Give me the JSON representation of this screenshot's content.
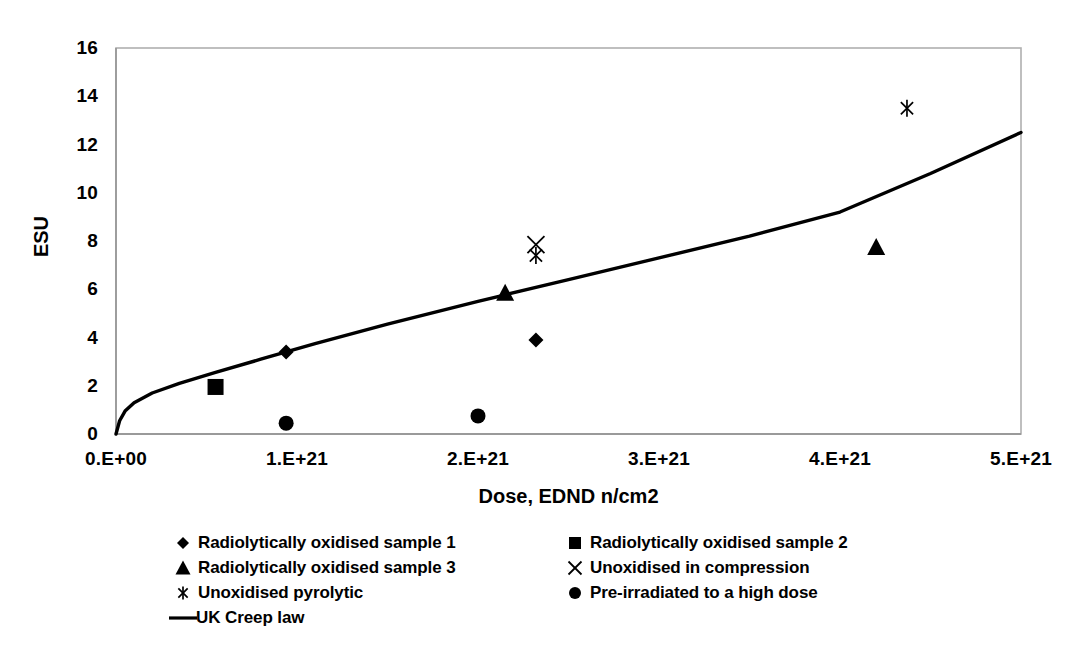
{
  "chart_data": {
    "type": "scatter",
    "title": "",
    "xlabel": "Dose, EDND n/cm2",
    "ylabel": "ESU",
    "xlim": [
      0,
      5e+21
    ],
    "ylim": [
      0,
      16
    ],
    "xticks": [
      "0.E+00",
      "1.E+21",
      "2.E+21",
      "3.E+21",
      "4.E+21",
      "5.E+21"
    ],
    "xtick_values": [
      0,
      1e+21,
      2e+21,
      3e+21,
      4e+21,
      5e+21
    ],
    "yticks": [
      "0",
      "2",
      "4",
      "6",
      "8",
      "10",
      "12",
      "14",
      "16"
    ],
    "ytick_values": [
      0,
      2,
      4,
      6,
      8,
      10,
      12,
      14,
      16
    ],
    "grid": false,
    "legend_position": "bottom",
    "series": [
      {
        "name": "Radiolytically oxidised sample 1",
        "marker": "diamond",
        "color": "#000000",
        "points": [
          {
            "x": 9.4e+20,
            "y": 3.4
          },
          {
            "x": 2.32e+21,
            "y": 3.9
          }
        ]
      },
      {
        "name": "Radiolytically oxidised sample 2",
        "marker": "square",
        "color": "#000000",
        "points": [
          {
            "x": 5.5e+20,
            "y": 1.95
          }
        ]
      },
      {
        "name": "Radiolytically oxidised sample 3",
        "marker": "triangle",
        "color": "#000000",
        "points": [
          {
            "x": 2.15e+21,
            "y": 5.85
          },
          {
            "x": 4.2e+21,
            "y": 7.75
          }
        ]
      },
      {
        "name": "Unoxidised in compression",
        "marker": "cross",
        "color": "#000000",
        "points": [
          {
            "x": 2.32e+21,
            "y": 7.85
          }
        ]
      },
      {
        "name": "Unoxidised pyrolytic",
        "marker": "asterisk",
        "color": "#000000",
        "points": [
          {
            "x": 2.32e+21,
            "y": 7.4
          },
          {
            "x": 4.37e+21,
            "y": 13.5
          }
        ]
      },
      {
        "name": "Pre-irradiated to a high dose",
        "marker": "circle",
        "color": "#000000",
        "points": [
          {
            "x": 9.4e+20,
            "y": 0.45
          },
          {
            "x": 2e+21,
            "y": 0.75
          }
        ]
      },
      {
        "name": "UK Creep law",
        "marker": "line",
        "color": "#000000",
        "curve": [
          {
            "x": 0.0,
            "y": 0.0
          },
          {
            "x": 2e+19,
            "y": 0.55
          },
          {
            "x": 5e+19,
            "y": 0.95
          },
          {
            "x": 1e+20,
            "y": 1.3
          },
          {
            "x": 2e+20,
            "y": 1.7
          },
          {
            "x": 3.5e+20,
            "y": 2.1
          },
          {
            "x": 5.5e+20,
            "y": 2.55
          },
          {
            "x": 8e+20,
            "y": 3.1
          },
          {
            "x": 1.1e+21,
            "y": 3.75
          },
          {
            "x": 1.5e+21,
            "y": 4.55
          },
          {
            "x": 2e+21,
            "y": 5.5
          },
          {
            "x": 2.5e+21,
            "y": 6.4
          },
          {
            "x": 3e+21,
            "y": 7.3
          },
          {
            "x": 3.5e+21,
            "y": 8.2
          },
          {
            "x": 4e+21,
            "y": 9.2
          },
          {
            "x": 4.5e+21,
            "y": 10.8
          },
          {
            "x": 5e+21,
            "y": 12.5
          }
        ]
      }
    ]
  },
  "legend": {
    "entries": [
      {
        "marker": "diamond",
        "label": "Radiolytically oxidised sample 1"
      },
      {
        "marker": "square",
        "label": "Radiolytically oxidised sample 2"
      },
      {
        "marker": "triangle",
        "label": "Radiolytically oxidised sample 3"
      },
      {
        "marker": "cross",
        "label": "Unoxidised in compression"
      },
      {
        "marker": "asterisk",
        "label": "Unoxidised pyrolytic"
      },
      {
        "marker": "circle",
        "label": "Pre-irradiated to a high dose"
      },
      {
        "marker": "line",
        "label": "UK Creep law"
      }
    ]
  },
  "colors": {
    "series": "#000000",
    "axis": "#000000",
    "frame": "#b0b0b0",
    "background": "#ffffff"
  }
}
